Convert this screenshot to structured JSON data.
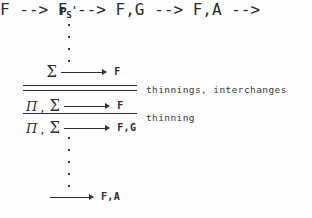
{
  "figure": {
    "type": "sequent-calculus-derivation",
    "top_formula": {
      "base": "P",
      "subscript": "S",
      "prime": "'"
    },
    "vdots_top_count": 4,
    "vdots_bottom_count": 5,
    "sequents": [
      {
        "antecedent_pi": "",
        "antecedent_comma": "",
        "antecedent_sigma": "Σ",
        "arrow": "⟶",
        "succedent": "F"
      },
      {
        "antecedent_pi": "Π",
        "antecedent_comma": ",",
        "antecedent_sigma": "Σ",
        "arrow": "⟶",
        "succedent": "F"
      },
      {
        "antecedent_pi": "Π",
        "antecedent_comma": ",",
        "antecedent_sigma": "Σ",
        "arrow": "⟶",
        "succedent": "F,G"
      },
      {
        "antecedent_pi": "",
        "antecedent_comma": "",
        "antecedent_sigma": "",
        "arrow": "⟶",
        "succedent": "F,A"
      }
    ],
    "rules": [
      {
        "style": "double",
        "annotation": "thinnings, interchanges"
      },
      {
        "style": "single",
        "annotation": "thinning"
      }
    ],
    "colors": {
      "ink": "#2f2f2f",
      "paper": "#fefefe"
    }
  }
}
